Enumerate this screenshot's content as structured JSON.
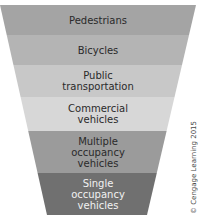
{
  "diagram": {
    "type": "inverted-pyramid",
    "geometry": {
      "top_y": 5,
      "bottom_y": 215,
      "top_left_x": 0,
      "top_right_x": 196,
      "bottom_left_x": 47,
      "bottom_right_x": 147
    },
    "bands": [
      {
        "label": "Pedestrians",
        "y0": 5,
        "y1": 35,
        "color": "#a4a4a4",
        "text_color": "dark"
      },
      {
        "label": "Bicycles",
        "y0": 35,
        "y1": 65,
        "color": "#b4b4b4",
        "text_color": "dark"
      },
      {
        "label": "Public\ntransportation",
        "y0": 65,
        "y1": 97,
        "color": "#c8c8c8",
        "text_color": "dark"
      },
      {
        "label": "Commercial\nvehicles",
        "y0": 97,
        "y1": 131,
        "color": "#d7d7d7",
        "text_color": "dark"
      },
      {
        "label": "Multiple\noccupancy\nvehicles",
        "y0": 131,
        "y1": 173,
        "color": "#9b9b9b",
        "text_color": "dark"
      },
      {
        "label": "Single\noccupancy\nvehicles",
        "y0": 173,
        "y1": 215,
        "color": "#707070",
        "text_color": "light"
      }
    ]
  },
  "copyright": "© Cengage Learning 2015"
}
